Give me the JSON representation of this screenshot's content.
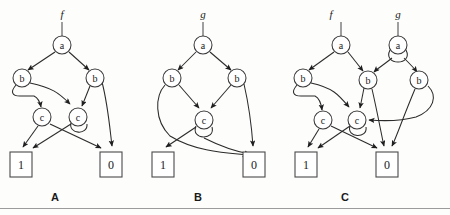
{
  "figure": {
    "kind": "binary-decision-diagram-figure",
    "background_color": "#fdfdfc",
    "line_color": "#2b2b2b",
    "node_fill": "#ffffff",
    "rule_color": "#9b9b9b",
    "panel_labels": [
      {
        "id": "A",
        "text": "A",
        "x": 55,
        "y": 197
      },
      {
        "id": "B",
        "text": "B",
        "x": 198,
        "y": 197
      },
      {
        "id": "C",
        "text": "C",
        "x": 345,
        "y": 197
      }
    ],
    "panels": [
      {
        "id": "A",
        "caption": "A",
        "roots": [
          {
            "name": "f",
            "x": 62,
            "y": 14,
            "target": "a1"
          }
        ],
        "nodes": [
          {
            "id": "a1",
            "label": "a",
            "x": 62,
            "y": 45,
            "r": 9
          },
          {
            "id": "b1",
            "label": "b",
            "x": 22,
            "y": 78,
            "r": 9
          },
          {
            "id": "b2",
            "label": "b",
            "x": 95,
            "y": 78,
            "r": 9
          },
          {
            "id": "c1",
            "label": "c",
            "x": 42,
            "y": 117,
            "r": 9
          },
          {
            "id": "c2",
            "label": "c",
            "x": 78,
            "y": 117,
            "r": 9
          }
        ],
        "terminals": [
          {
            "id": "t1",
            "label": "1",
            "x": 10,
            "y": 152,
            "w": 22,
            "h": 25
          },
          {
            "id": "t0",
            "label": "0",
            "x": 100,
            "y": 152,
            "w": 22,
            "h": 25
          }
        ],
        "edges": [
          {
            "from": "a1",
            "to": "b1",
            "kind": "line"
          },
          {
            "from": "a1",
            "to": "b2",
            "kind": "line"
          },
          {
            "from": "b1",
            "to": "c1",
            "kind": "hook-left"
          },
          {
            "from": "b1",
            "to": "c2",
            "kind": "long-curve"
          },
          {
            "from": "b2",
            "to": "c2",
            "kind": "line"
          },
          {
            "from": "b2",
            "to": "t0",
            "kind": "line"
          },
          {
            "from": "c1",
            "to": "t1",
            "kind": "line"
          },
          {
            "from": "c1",
            "to": "t0",
            "kind": "line"
          },
          {
            "from": "c2",
            "to": "t1",
            "kind": "line"
          },
          {
            "from": "c2",
            "to": "c2",
            "kind": "self-loop"
          }
        ]
      },
      {
        "id": "B",
        "caption": "B",
        "roots": [
          {
            "name": "g",
            "x": 203,
            "y": 14,
            "target": "a1"
          }
        ],
        "nodes": [
          {
            "id": "a1",
            "label": "a",
            "x": 203,
            "y": 45,
            "r": 9
          },
          {
            "id": "b1",
            "label": "b",
            "x": 172,
            "y": 78,
            "r": 9
          },
          {
            "id": "b2",
            "label": "b",
            "x": 237,
            "y": 78,
            "r": 9
          },
          {
            "id": "c1",
            "label": "c",
            "x": 204,
            "y": 120,
            "r": 9
          }
        ],
        "terminals": [
          {
            "id": "t1",
            "label": "1",
            "x": 152,
            "y": 152,
            "w": 22,
            "h": 25
          },
          {
            "id": "t0",
            "label": "0",
            "x": 243,
            "y": 152,
            "w": 22,
            "h": 25
          }
        ],
        "edges": [
          {
            "from": "a1",
            "to": "b1",
            "kind": "line"
          },
          {
            "from": "a1",
            "to": "b2",
            "kind": "line"
          },
          {
            "from": "b1",
            "to": "c1",
            "kind": "line"
          },
          {
            "from": "b1",
            "to": "t0",
            "kind": "long-curve"
          },
          {
            "from": "b2",
            "to": "c1",
            "kind": "line"
          },
          {
            "from": "b2",
            "to": "t0",
            "kind": "line"
          },
          {
            "from": "c1",
            "to": "t1",
            "kind": "line"
          },
          {
            "from": "c1",
            "to": "self",
            "kind": "self-loop"
          }
        ]
      },
      {
        "id": "C",
        "caption": "C",
        "roots": [
          {
            "name": "f",
            "x": 322,
            "y": 14,
            "target": "a1"
          },
          {
            "name": "g",
            "x": 393,
            "y": 14,
            "target": "a2"
          }
        ],
        "nodes": [
          {
            "id": "a1",
            "label": "a",
            "x": 341,
            "y": 45,
            "r": 9
          },
          {
            "id": "a2",
            "label": "a",
            "x": 398,
            "y": 45,
            "r": 9
          },
          {
            "id": "b1",
            "label": "b",
            "x": 303,
            "y": 78,
            "r": 9
          },
          {
            "id": "b2",
            "label": "b",
            "x": 368,
            "y": 80,
            "r": 9
          },
          {
            "id": "b3",
            "label": "b",
            "x": 419,
            "y": 80,
            "r": 9
          },
          {
            "id": "c1",
            "label": "c",
            "x": 323,
            "y": 120,
            "r": 9
          },
          {
            "id": "c2",
            "label": "c",
            "x": 357,
            "y": 120,
            "r": 9
          }
        ],
        "terminals": [
          {
            "id": "t1",
            "label": "1",
            "x": 295,
            "y": 152,
            "w": 22,
            "h": 25
          },
          {
            "id": "t0",
            "label": "0",
            "x": 376,
            "y": 152,
            "w": 22,
            "h": 25
          }
        ],
        "edges": [
          {
            "from": "a1",
            "to": "b1",
            "kind": "line"
          },
          {
            "from": "a1",
            "to": "b2",
            "kind": "line"
          },
          {
            "from": "a2",
            "to": "b2",
            "kind": "line"
          },
          {
            "from": "a2",
            "to": "b3",
            "kind": "line"
          },
          {
            "from": "a2",
            "to": "self",
            "kind": "self-loop"
          },
          {
            "from": "b1",
            "to": "c1",
            "kind": "hook-left"
          },
          {
            "from": "b1",
            "to": "c2",
            "kind": "long-curve"
          },
          {
            "from": "b2",
            "to": "c2",
            "kind": "line"
          },
          {
            "from": "b2",
            "to": "t0",
            "kind": "line"
          },
          {
            "from": "b3",
            "to": "c2",
            "kind": "wide-curve"
          },
          {
            "from": "b3",
            "to": "t0",
            "kind": "line"
          },
          {
            "from": "c1",
            "to": "t1",
            "kind": "line"
          },
          {
            "from": "c1",
            "to": "t0",
            "kind": "line"
          },
          {
            "from": "c2",
            "to": "t1",
            "kind": "line"
          },
          {
            "from": "c2",
            "to": "self",
            "kind": "self-loop"
          }
        ]
      }
    ]
  }
}
